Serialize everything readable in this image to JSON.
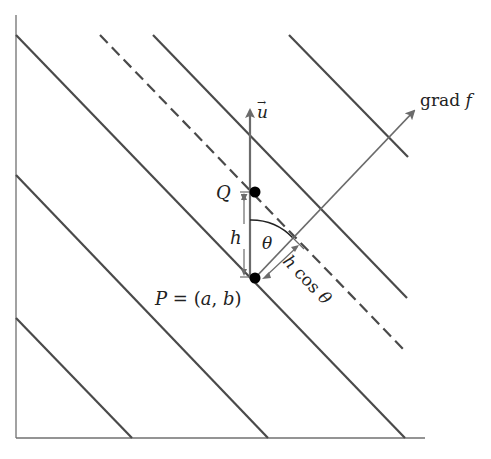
{
  "diagram": {
    "colors": {
      "contour": "#4a4a4a",
      "axis": "#707070",
      "vector": "#6b6b6b",
      "point": "#000000",
      "text": "#222222"
    },
    "labels": {
      "u_vector": "u",
      "u_arrow": "→",
      "grad_prefix": "grad ",
      "grad_f": "f",
      "Q": "Q",
      "h": "h",
      "theta": "θ",
      "P_name": "P",
      "P_eq": " = (",
      "P_a": "a",
      "P_comma": ", ",
      "P_b": "b",
      "P_close": ")",
      "hcos_h": "h",
      "hcos_cos": " cos ",
      "hcos_theta": "θ"
    },
    "points": {
      "P": {
        "x": 255,
        "y": 278
      },
      "Q": {
        "x": 255,
        "y": 192
      }
    },
    "contours": [
      {
        "id": "contour-1",
        "style": "solid",
        "from": [
          16,
          35
        ],
        "to": [
          405,
          438
        ]
      },
      {
        "id": "contour-2",
        "style": "solid",
        "from": [
          16,
          175
        ],
        "to": [
          268,
          438
        ]
      },
      {
        "id": "contour-3",
        "style": "solid",
        "from": [
          16,
          318
        ],
        "to": [
          132,
          438
        ]
      },
      {
        "id": "contour-through-Q",
        "style": "dashed",
        "from": [
          100,
          35
        ],
        "to": [
          405,
          351
        ]
      },
      {
        "id": "contour-4",
        "style": "solid",
        "from": [
          153,
          35
        ],
        "to": [
          407,
          298
        ]
      },
      {
        "id": "contour-5",
        "style": "solid",
        "from": [
          289,
          35
        ],
        "to": [
          408,
          157
        ]
      }
    ]
  }
}
